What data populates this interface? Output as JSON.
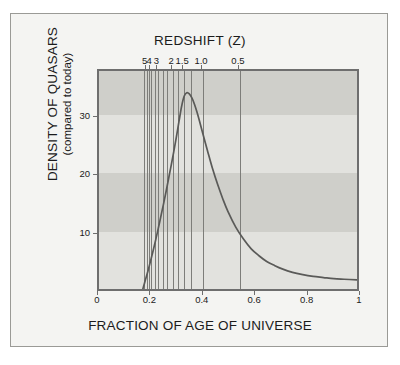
{
  "figure": {
    "background_color": "#f4f4f2",
    "border_color": "#9a9a96",
    "plot_background_color": "#d6d6d2",
    "band_light_color": "#e2e2de",
    "band_dark_color": "#cfcfca",
    "curve_color": "#5a5a58",
    "gridline_color": "#7d7d79",
    "axis_color": "#6e6e6e"
  },
  "chart_data": {
    "type": "line",
    "title": "REDSHIFT (Z)",
    "xlabel": "FRACTION OF AGE OF UNIVERSE",
    "ylabel": "DENSITY OF QUASARS",
    "ylabel_sub": "(compared to today)",
    "xlim": [
      0,
      1
    ],
    "ylim": [
      0,
      38
    ],
    "grid": false,
    "legend": null,
    "x_ticks": [
      {
        "value": 0,
        "label": "0"
      },
      {
        "value": 0.2,
        "label": "0.2"
      },
      {
        "value": 0.4,
        "label": "0.4"
      },
      {
        "value": 0.6,
        "label": "0.6"
      },
      {
        "value": 0.8,
        "label": "0.8"
      },
      {
        "value": 1.0,
        "label": "1"
      }
    ],
    "y_ticks": [
      {
        "value": 10,
        "label": "10"
      },
      {
        "value": 20,
        "label": "20"
      },
      {
        "value": 30,
        "label": "30"
      }
    ],
    "top_axis": {
      "name": "REDSHIFT (Z)",
      "ticks": [
        {
          "label": "5",
          "x": 0.182
        },
        {
          "label": "4",
          "x": 0.199
        },
        {
          "label": "3",
          "x": 0.227
        },
        {
          "label": "2",
          "x": 0.283
        },
        {
          "label": "1.5",
          "x": 0.325
        },
        {
          "label": "1.0",
          "x": 0.397
        },
        {
          "label": "0.5",
          "x": 0.538
        }
      ],
      "unlabeled_ticks": [
        0.172,
        0.19,
        0.212,
        0.243,
        0.258,
        0.303,
        0.352
      ]
    },
    "bands": [
      {
        "y_from": 30.5,
        "y_to": 38.0,
        "shade": "dark"
      },
      {
        "y_from": 20.5,
        "y_to": 30.5,
        "shade": "light"
      },
      {
        "y_from": 10.5,
        "y_to": 20.5,
        "shade": "dark"
      },
      {
        "y_from": 0.0,
        "y_to": 10.5,
        "shade": "light"
      }
    ],
    "series": [
      {
        "name": "Density of quasars",
        "points": [
          [
            0.17,
            0.0
          ],
          [
            0.18,
            1.6
          ],
          [
            0.19,
            3.2
          ],
          [
            0.2,
            4.9
          ],
          [
            0.21,
            6.7
          ],
          [
            0.22,
            8.6
          ],
          [
            0.23,
            10.6
          ],
          [
            0.24,
            12.7
          ],
          [
            0.25,
            14.8
          ],
          [
            0.26,
            17.0
          ],
          [
            0.27,
            19.3
          ],
          [
            0.28,
            21.6
          ],
          [
            0.29,
            24.0
          ],
          [
            0.3,
            26.5
          ],
          [
            0.31,
            29.2
          ],
          [
            0.32,
            31.8
          ],
          [
            0.33,
            33.6
          ],
          [
            0.34,
            34.2
          ],
          [
            0.35,
            34.0
          ],
          [
            0.36,
            33.3
          ],
          [
            0.37,
            32.2
          ],
          [
            0.38,
            30.8
          ],
          [
            0.39,
            29.2
          ],
          [
            0.4,
            27.5
          ],
          [
            0.42,
            24.2
          ],
          [
            0.44,
            21.0
          ],
          [
            0.46,
            18.2
          ],
          [
            0.48,
            15.7
          ],
          [
            0.5,
            13.5
          ],
          [
            0.53,
            10.8
          ],
          [
            0.56,
            8.7
          ],
          [
            0.59,
            7.0
          ],
          [
            0.62,
            5.8
          ],
          [
            0.65,
            4.8
          ],
          [
            0.68,
            4.1
          ],
          [
            0.71,
            3.5
          ],
          [
            0.75,
            2.9
          ],
          [
            0.79,
            2.5
          ],
          [
            0.83,
            2.2
          ],
          [
            0.87,
            2.0
          ],
          [
            0.91,
            1.8
          ],
          [
            0.95,
            1.7
          ],
          [
            1.0,
            1.6
          ]
        ]
      }
    ]
  }
}
